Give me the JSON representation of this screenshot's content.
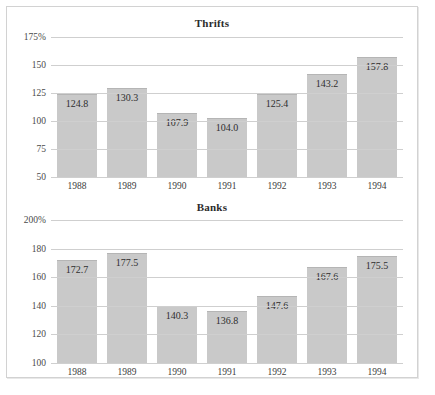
{
  "chart_data": [
    {
      "type": "bar",
      "title": "Thrifts",
      "xlabel": "",
      "ylabel": "",
      "categories": [
        "1988",
        "1989",
        "1990",
        "1991",
        "1992",
        "1993",
        "1994"
      ],
      "values": [
        124.8,
        130.3,
        107.9,
        104.0,
        125.4,
        143.2,
        157.8
      ],
      "value_labels": [
        "124.8",
        "130.3",
        "107.9",
        "104.0",
        "125.4",
        "143.2",
        "157.8"
      ],
      "ylim": [
        50,
        175
      ],
      "yticks": [
        50,
        75,
        100,
        125,
        150,
        175
      ],
      "ytick_labels": [
        "50",
        "75",
        "100",
        "125",
        "150",
        "175%"
      ],
      "grid": true,
      "legend": "none",
      "bar_color": "#c9c9c9"
    },
    {
      "type": "bar",
      "title": "Banks",
      "xlabel": "",
      "ylabel": "",
      "categories": [
        "1988",
        "1989",
        "1990",
        "1991",
        "1992",
        "1993",
        "1994"
      ],
      "values": [
        172.7,
        177.5,
        140.3,
        136.8,
        147.6,
        167.6,
        175.5
      ],
      "value_labels": [
        "172.7",
        "177.5",
        "140.3",
        "136.8",
        "147.6",
        "167.6",
        "175.5"
      ],
      "ylim": [
        100,
        200
      ],
      "yticks": [
        100,
        120,
        140,
        160,
        180,
        200
      ],
      "ytick_labels": [
        "100",
        "120",
        "140",
        "160",
        "180",
        "200%"
      ],
      "grid": true,
      "legend": "none",
      "bar_color": "#c9c9c9"
    }
  ]
}
